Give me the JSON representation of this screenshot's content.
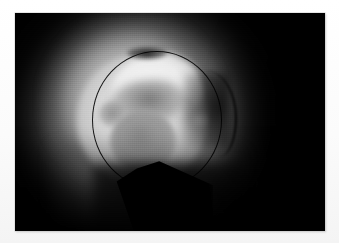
{
  "page": {
    "background_color": "#fdfdfd",
    "width": 339,
    "height": 243,
    "caption": ""
  },
  "photo": {
    "name": "endoscopic-photograph",
    "alt_text": "Grayscale endoscopic photograph showing an illuminated circular field of view with bright tissue and a rounded grey lesion",
    "frame_color": "#000000",
    "modality": "grayscale endoscopic / arthroscopic still",
    "x": 15,
    "y": 13,
    "width": 310,
    "height": 218
  },
  "features": [
    {
      "name": "illumination-halo",
      "label": "Scope illumination halo",
      "center_x": 146,
      "center_y": 116,
      "color": "#bebebe"
    },
    {
      "name": "scope-field-ring",
      "label": "Dark circular scope field outline",
      "center_x": 148,
      "center_y": 120,
      "radius_x": 65,
      "radius_y": 69,
      "color": "#060606"
    },
    {
      "name": "bright-tissue-mass",
      "label": "Bright tissue surface",
      "color": "#dadada"
    },
    {
      "name": "upper-tissue-lobe",
      "label": "Bright upper tissue lobe",
      "color": "#ececec"
    },
    {
      "name": "tissue-groove",
      "label": "Dark crevice between lobes",
      "color": "#606060"
    },
    {
      "name": "grey-lesion",
      "label": "Rounded grey lesion",
      "center_x": 143,
      "center_y": 141,
      "color": "#9a9a9a"
    },
    {
      "name": "satellite-spot",
      "label": "Small satellite grey spot",
      "color": "#8c8c8c"
    },
    {
      "name": "instrument-thread",
      "label": "Dark thread / instrument shaft",
      "color": "#000000"
    },
    {
      "name": "dark-wedge",
      "label": "Dark shadow wedge from below",
      "color": "#000000"
    }
  ]
}
